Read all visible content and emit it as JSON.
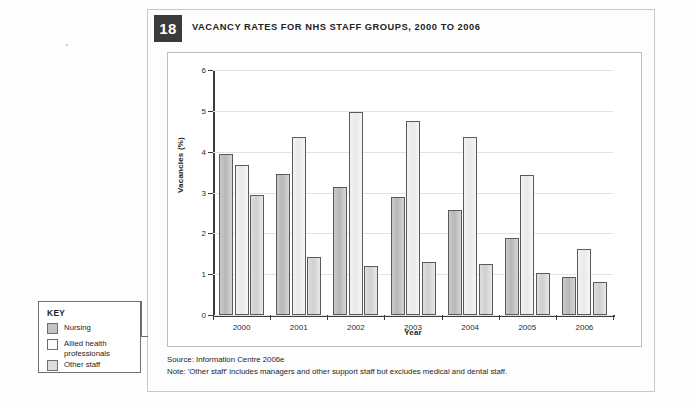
{
  "figure": {
    "number": "18",
    "title": "VACANCY RATES FOR NHS STAFF GROUPS, 2000 TO 2006",
    "source": "Source: Information Centre 2006e",
    "note": "Note: 'Other staff' includes managers and other support staff but excludes medical and dental staff."
  },
  "key": {
    "heading": "KEY",
    "items": [
      {
        "label": "Nursing"
      },
      {
        "label": "Allied health professionals"
      },
      {
        "label": "Other staff"
      }
    ]
  },
  "chart_data": {
    "type": "bar",
    "title": "VACANCY RATES FOR NHS STAFF GROUPS, 2000 TO 2006",
    "xlabel": "Year",
    "ylabel": "Vacancies (%)",
    "categories": [
      "2000",
      "2001",
      "2002",
      "2003",
      "2004",
      "2005",
      "2006"
    ],
    "series": [
      {
        "name": "Nursing",
        "color": "#c4c4c4",
        "values": [
          3.95,
          3.45,
          3.13,
          2.88,
          2.58,
          1.88,
          0.93
        ]
      },
      {
        "name": "Allied health professionals",
        "color": "#f2f2f2",
        "values": [
          3.67,
          4.35,
          4.97,
          4.75,
          4.35,
          3.43,
          1.62
        ]
      },
      {
        "name": "Other staff",
        "color": "#dcdcdc",
        "values": [
          2.93,
          1.42,
          1.2,
          1.3,
          1.26,
          1.03,
          0.82
        ]
      }
    ],
    "ylim": [
      0,
      6
    ],
    "yticks": [
      0,
      1,
      2,
      3,
      4,
      5,
      6
    ],
    "grid": true,
    "legend_position": "outside-left"
  }
}
